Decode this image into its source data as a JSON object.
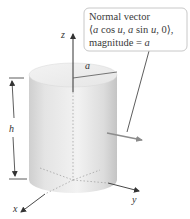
{
  "diagram": {
    "type": "cylinder-normal-vector",
    "callout": {
      "line1": "Normal vector",
      "line2_parts": [
        "⟨",
        "a",
        " cos ",
        "u",
        ", ",
        "a",
        " sin ",
        "u",
        ", 0⟩,"
      ],
      "line3_parts": [
        "magnitude = ",
        "a"
      ]
    },
    "labels": {
      "z_axis": "z",
      "x_axis": "x",
      "y_axis": "y",
      "radius": "a",
      "height": "h"
    },
    "colors": {
      "axis": "#333333",
      "cylinder_light": "#f0f0f0",
      "cylinder_dark": "#c9c9c9",
      "normal_arrow": "#8c8c8c",
      "callout_border": "#c8c8c8"
    }
  }
}
